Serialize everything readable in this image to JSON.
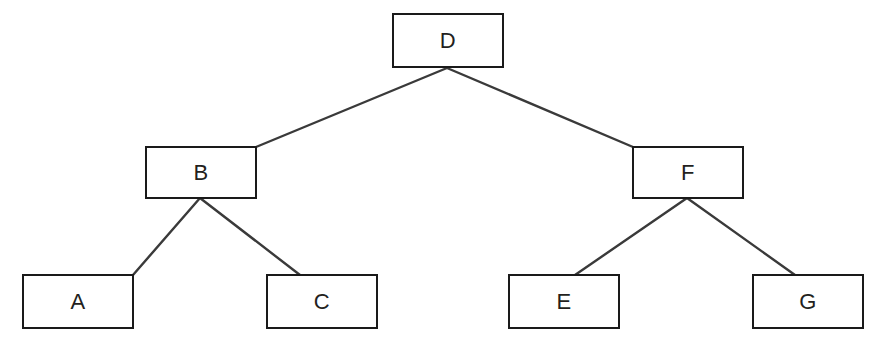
{
  "diagram": {
    "type": "binary-tree",
    "background_color": "#ffffff",
    "node_border_color": "#1a1a1a",
    "node_fill_color": "#ffffff",
    "edge_color": "#3a3a3a",
    "label_color": "#231f20",
    "nodes": [
      {
        "id": "D",
        "label": "D",
        "level": 0,
        "x": 392,
        "y": 13,
        "w": 112,
        "h": 55
      },
      {
        "id": "B",
        "label": "B",
        "level": 1,
        "x": 145,
        "y": 146,
        "w": 112,
        "h": 53
      },
      {
        "id": "F",
        "label": "F",
        "level": 1,
        "x": 632,
        "y": 146,
        "w": 112,
        "h": 53
      },
      {
        "id": "A",
        "label": "A",
        "level": 2,
        "x": 22,
        "y": 274,
        "w": 112,
        "h": 55
      },
      {
        "id": "C",
        "label": "C",
        "level": 2,
        "x": 266,
        "y": 274,
        "w": 112,
        "h": 55
      },
      {
        "id": "E",
        "label": "E",
        "level": 2,
        "x": 508,
        "y": 274,
        "w": 112,
        "h": 55
      },
      {
        "id": "G",
        "label": "G",
        "level": 2,
        "x": 752,
        "y": 274,
        "w": 112,
        "h": 55
      }
    ],
    "edges": [
      {
        "id": "D-B",
        "from": "D",
        "to": "B",
        "x1": 447,
        "y1": 68,
        "x2": 256,
        "y2": 147
      },
      {
        "id": "D-F",
        "from": "D",
        "to": "F",
        "x1": 447,
        "y1": 68,
        "x2": 633,
        "y2": 147
      },
      {
        "id": "B-A",
        "from": "B",
        "to": "A",
        "x1": 200,
        "y1": 198,
        "x2": 133,
        "y2": 275
      },
      {
        "id": "B-C",
        "from": "B",
        "to": "C",
        "x1": 200,
        "y1": 198,
        "x2": 300,
        "y2": 275
      },
      {
        "id": "F-E",
        "from": "F",
        "to": "E",
        "x1": 687,
        "y1": 198,
        "x2": 575,
        "y2": 275
      },
      {
        "id": "F-G",
        "from": "F",
        "to": "G",
        "x1": 687,
        "y1": 198,
        "x2": 795,
        "y2": 275
      }
    ]
  }
}
